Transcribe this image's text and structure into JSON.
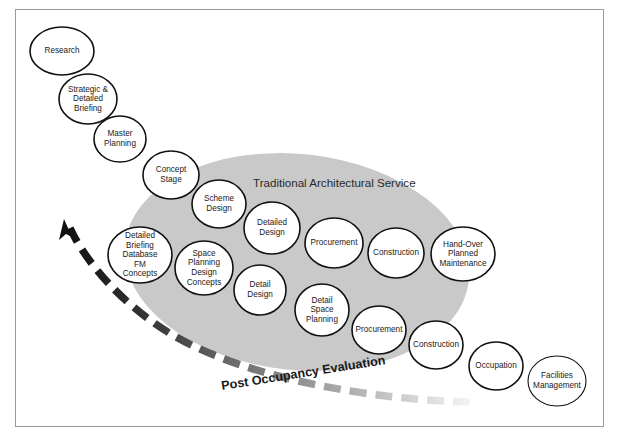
{
  "diagram": {
    "frame": {
      "border_color": "#9a9a9a",
      "background": "#ffffff"
    },
    "region": {
      "label": "Traditional Architectural Service",
      "fill_color": "#c9c9c9",
      "cx": 297,
      "cy": 262,
      "rx": 173,
      "ry": 108,
      "rotation": 6,
      "label_x": 253,
      "label_y": 187
    },
    "arrow_arc": {
      "label": "Post Occupancy Evaluation",
      "label_x": 222,
      "label_y": 390,
      "label_rotation": -9,
      "direction": "right-to-left (fading grey to black, arrowhead top-left)",
      "start_color": "#f2f2f2",
      "end_color": "#111111",
      "arrowhead_tip_x": 64,
      "arrowhead_tip_y": 221
    },
    "nodes": [
      {
        "label": [
          "Research"
        ],
        "cx": 62,
        "cy": 51,
        "rx": 32,
        "ry": 24,
        "stroke": "normal"
      },
      {
        "label": [
          "Strategic &",
          "Detailed",
          "Briefing"
        ],
        "cx": 88,
        "cy": 99,
        "rx": 29,
        "ry": 25,
        "stroke": "normal"
      },
      {
        "label": [
          "Master",
          "Planning"
        ],
        "cx": 120,
        "cy": 139,
        "rx": 26,
        "ry": 23,
        "stroke": "normal"
      },
      {
        "label": [
          "Concept",
          "Stage"
        ],
        "cx": 171,
        "cy": 175,
        "rx": 28,
        "ry": 24,
        "stroke": "normal"
      },
      {
        "label": [
          "Scheme",
          "Design"
        ],
        "cx": 219,
        "cy": 204,
        "rx": 27,
        "ry": 24,
        "stroke": "normal"
      },
      {
        "label": [
          "Detailed",
          "Briefing",
          "Database",
          "FM",
          "Concepts"
        ],
        "cx": 140,
        "cy": 255,
        "rx": 32,
        "ry": 28,
        "stroke": "normal"
      },
      {
        "label": [
          "Space",
          "Planning",
          "Design",
          "Concepts"
        ],
        "cx": 204,
        "cy": 268,
        "rx": 29,
        "ry": 27,
        "stroke": "normal"
      },
      {
        "label": [
          "Detailed",
          "Design"
        ],
        "cx": 272,
        "cy": 228,
        "rx": 28,
        "ry": 26,
        "stroke": "normal"
      },
      {
        "label": [
          "Detail",
          "Design"
        ],
        "cx": 260,
        "cy": 290,
        "rx": 26,
        "ry": 25,
        "stroke": "normal"
      },
      {
        "label": [
          "Procurement"
        ],
        "cx": 334,
        "cy": 243,
        "rx": 29,
        "ry": 25,
        "stroke": "normal"
      },
      {
        "label": [
          "Detail",
          "Space",
          "Planning"
        ],
        "cx": 322,
        "cy": 310,
        "rx": 27,
        "ry": 26,
        "stroke": "normal"
      },
      {
        "label": [
          "Construction"
        ],
        "cx": 396,
        "cy": 253,
        "rx": 28,
        "ry": 25,
        "stroke": "normal"
      },
      {
        "label": [
          "Hand-Over",
          "Planned",
          "Maintenance"
        ],
        "cx": 463,
        "cy": 254,
        "rx": 32,
        "ry": 27,
        "stroke": "normal"
      },
      {
        "label": [
          "Procurement"
        ],
        "cx": 379,
        "cy": 330,
        "rx": 27,
        "ry": 24,
        "stroke": "normal"
      },
      {
        "label": [
          "Construction"
        ],
        "cx": 436,
        "cy": 345,
        "rx": 27,
        "ry": 24,
        "stroke": "normal"
      },
      {
        "label": [
          "Occupation"
        ],
        "cx": 496,
        "cy": 366,
        "rx": 27,
        "ry": 24,
        "stroke": "normal"
      },
      {
        "label": [
          "Facilities",
          "Management"
        ],
        "cx": 557,
        "cy": 381,
        "rx": 29,
        "ry": 25,
        "stroke": "thin"
      }
    ]
  }
}
